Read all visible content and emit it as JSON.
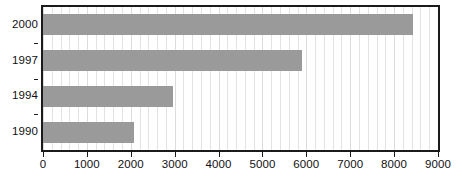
{
  "chart_data": {
    "type": "bar",
    "orientation": "horizontal",
    "title": "",
    "subtitle": "",
    "xlabel": "",
    "ylabel": "",
    "categories": [
      "2000",
      "1997",
      "1994",
      "1990"
    ],
    "values": [
      8430,
      5890,
      2960,
      2080
    ],
    "series": [
      {
        "name": "",
        "values": [
          8430,
          5890,
          2960,
          2080
        ]
      }
    ],
    "xlim": [
      0,
      9000
    ],
    "xticks": [
      0,
      1000,
      2000,
      3000,
      4000,
      5000,
      6000,
      7000,
      8000,
      9000
    ],
    "xtick_labels": [
      "0",
      "1000",
      "2000",
      "3000",
      "4000",
      "5000",
      "6000",
      "7000",
      "8000",
      "9000"
    ],
    "ytick_labels": [
      "2000",
      "1997",
      "1994",
      "1990"
    ],
    "minor_gridline_step": 200,
    "grid": "vertical-minor",
    "legend": "none",
    "legend_position": "none",
    "annotations": [],
    "colors": {
      "bar": "#9a9a9a",
      "gridline": "#e3e3e3",
      "axis": "#1b1b1b",
      "text": "#111111",
      "background": "#ffffff"
    }
  }
}
